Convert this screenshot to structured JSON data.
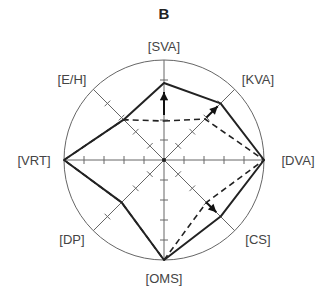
{
  "chart_data": {
    "type": "radar",
    "title": "B",
    "axes": [
      "SVA",
      "KVA",
      "DVA",
      "CS",
      "OMS",
      "DP",
      "VRT",
      "E/H"
    ],
    "axis_labels": [
      "[SVA]",
      "[KVA]",
      "[DVA]",
      "[CS]",
      "[OMS]",
      "[DP]",
      "[VRT]",
      "[E/H]"
    ],
    "range": [
      0,
      1
    ],
    "ticks_per_axis": 5,
    "series": [
      {
        "name": "solid",
        "style": "solid",
        "values": [
          0.77,
          0.8,
          1.0,
          0.8,
          1.0,
          0.6,
          1.0,
          0.57
        ]
      },
      {
        "name": "dashed",
        "style": "dashed",
        "values": [
          0.39,
          0.58,
          1.0,
          0.6,
          1.0,
          0.6,
          1.0,
          0.57
        ]
      }
    ],
    "arrows": [
      {
        "axis": "SVA",
        "from": 0.45,
        "to": 0.68
      },
      {
        "axis": "KVA",
        "from": 0.6,
        "to": 0.76
      },
      {
        "axis": "CS",
        "from": 0.6,
        "to": 0.74
      }
    ],
    "grid": "outer circle with 8 spokes and tick marks",
    "legend": null
  },
  "colors": {
    "line": "#222222",
    "grid": "#666666",
    "label": "#444444"
  }
}
